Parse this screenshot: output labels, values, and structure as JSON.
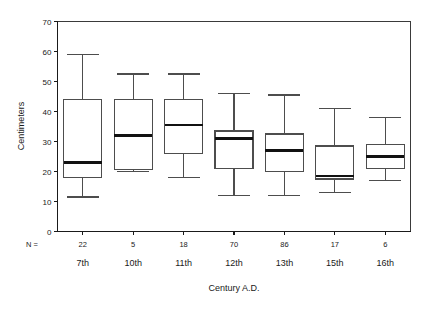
{
  "chart_data": {
    "type": "box",
    "title": "",
    "xlabel": "Century A.D.",
    "ylabel": "Centimeters",
    "ylim": [
      0,
      70
    ],
    "yticks": [
      0,
      10,
      20,
      30,
      40,
      50,
      60,
      70
    ],
    "ytick_labels": [
      "0",
      "10",
      "20",
      "30",
      "40",
      "50",
      "60",
      "70"
    ],
    "grid": false,
    "legend": "none",
    "n_prefix": "N =",
    "categories": [
      "7th",
      "10th",
      "11th",
      "12th",
      "13th",
      "15th",
      "16th"
    ],
    "counts": [
      22,
      5,
      18,
      70,
      86,
      17,
      6
    ],
    "boxes": [
      {
        "category": "7th",
        "n": 22,
        "whisker_low": 11.5,
        "q1": 18.0,
        "median": 23.0,
        "q3": 44.0,
        "whisker_high": 59.0
      },
      {
        "category": "10th",
        "n": 5,
        "whisker_low": 20.0,
        "q1": 20.8,
        "median": 32.0,
        "q3": 44.0,
        "whisker_high": 52.5
      },
      {
        "category": "11th",
        "n": 18,
        "whisker_low": 18.0,
        "q1": 26.0,
        "median": 35.5,
        "q3": 44.0,
        "whisker_high": 52.5
      },
      {
        "category": "12th",
        "n": 70,
        "whisker_low": 12.0,
        "q1": 21.0,
        "median": 31.0,
        "q3": 33.5,
        "whisker_high": 46.0
      },
      {
        "category": "13th",
        "n": 86,
        "whisker_low": 12.0,
        "q1": 20.0,
        "median": 27.0,
        "q3": 32.5,
        "whisker_high": 45.5
      },
      {
        "category": "15th",
        "n": 17,
        "whisker_low": 13.0,
        "q1": 17.5,
        "median": 18.5,
        "q3": 28.5,
        "whisker_high": 41.0
      },
      {
        "category": "16th",
        "n": 6,
        "whisker_low": 17.0,
        "q1": 21.0,
        "median": 25.0,
        "q3": 29.0,
        "whisker_high": 38.0
      }
    ]
  }
}
